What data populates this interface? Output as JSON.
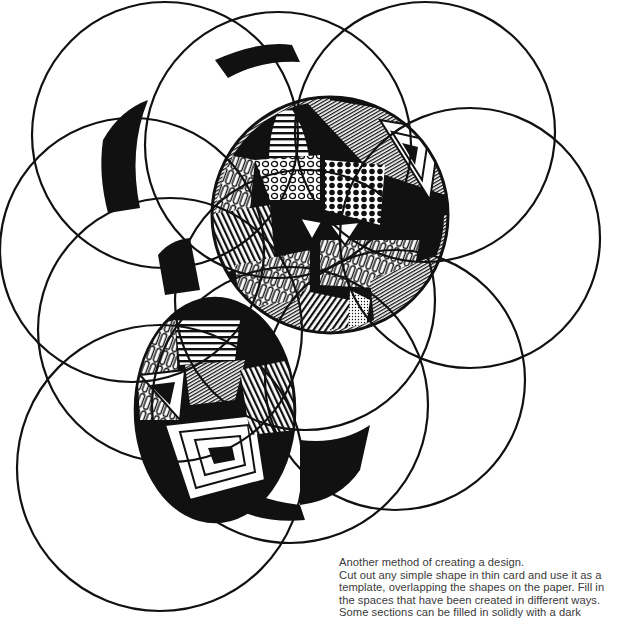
{
  "page": {
    "type": "scanned book illustration",
    "background_color": "#ffffff",
    "ink_color": "#111111"
  },
  "illustration": {
    "subject": "Overlapping circle template design with sections filled in solid black and patterned infill",
    "shape": "circle",
    "circle_count": 11,
    "fill_styles": [
      "solid black",
      "parallel stripes",
      "wavy loops",
      "open dots",
      "solid dots",
      "concentric triangles",
      "stippling",
      "concentric polygons",
      "radial hatching"
    ]
  },
  "caption": {
    "lines": [
      "Another method of creating a design.",
      "Cut out any simple shape in thin card and use it as a",
      "template, overlapping the shapes on the paper. Fill in",
      "the spaces that have been created in different ways.",
      "Some sections can be filled in solidly with a dark"
    ]
  }
}
